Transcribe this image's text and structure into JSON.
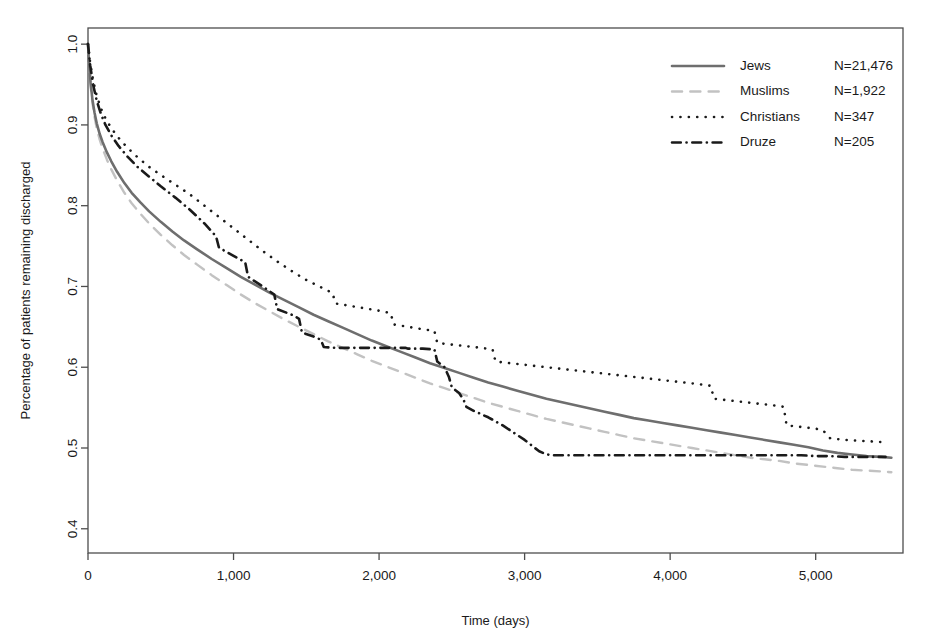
{
  "chart_data": {
    "type": "line",
    "title": "",
    "xlabel": "Time (days)",
    "ylabel": "Percentage of patients remaining discharged",
    "xlim": [
      0,
      5600
    ],
    "ylim": [
      0.37,
      1.02
    ],
    "xticks": [
      0,
      1000,
      2000,
      3000,
      4000,
      5000
    ],
    "xtick_labels": [
      "0",
      "1,000",
      "2,000",
      "3,000",
      "4,000",
      "5,000"
    ],
    "yticks": [
      0.4,
      0.5,
      0.6,
      0.7,
      0.8,
      0.9,
      1.0
    ],
    "ytick_labels": [
      "0.4",
      "0.5",
      "0.6",
      "0.7",
      "0.8",
      "0.9",
      "1.0"
    ],
    "grid": false,
    "frame": true,
    "legend_position": "top-right",
    "series": [
      {
        "name": "Jews",
        "count_label": "N=21,476",
        "style": "solid",
        "color": "#6e6e6e",
        "width": 2.6,
        "points": [
          [
            0,
            1.0
          ],
          [
            8,
            0.975
          ],
          [
            18,
            0.952
          ],
          [
            30,
            0.932
          ],
          [
            45,
            0.915
          ],
          [
            60,
            0.902
          ],
          [
            80,
            0.889
          ],
          [
            100,
            0.879
          ],
          [
            130,
            0.866
          ],
          [
            160,
            0.855
          ],
          [
            200,
            0.842
          ],
          [
            250,
            0.828
          ],
          [
            300,
            0.816
          ],
          [
            360,
            0.804
          ],
          [
            420,
            0.793
          ],
          [
            500,
            0.78
          ],
          [
            580,
            0.768
          ],
          [
            660,
            0.757
          ],
          [
            750,
            0.746
          ],
          [
            850,
            0.734
          ],
          [
            950,
            0.723
          ],
          [
            1050,
            0.712
          ],
          [
            1150,
            0.702
          ],
          [
            1250,
            0.692
          ],
          [
            1350,
            0.683
          ],
          [
            1450,
            0.674
          ],
          [
            1550,
            0.665
          ],
          [
            1650,
            0.657
          ],
          [
            1750,
            0.649
          ],
          [
            1850,
            0.641
          ],
          [
            1950,
            0.633
          ],
          [
            2050,
            0.626
          ],
          [
            2150,
            0.619
          ],
          [
            2250,
            0.612
          ],
          [
            2350,
            0.605
          ],
          [
            2450,
            0.599
          ],
          [
            2550,
            0.593
          ],
          [
            2650,
            0.587
          ],
          [
            2750,
            0.581
          ],
          [
            2850,
            0.576
          ],
          [
            2950,
            0.571
          ],
          [
            3050,
            0.566
          ],
          [
            3150,
            0.561
          ],
          [
            3250,
            0.557
          ],
          [
            3350,
            0.553
          ],
          [
            3450,
            0.549
          ],
          [
            3550,
            0.545
          ],
          [
            3650,
            0.541
          ],
          [
            3750,
            0.537
          ],
          [
            3850,
            0.534
          ],
          [
            3950,
            0.531
          ],
          [
            4050,
            0.528
          ],
          [
            4150,
            0.525
          ],
          [
            4250,
            0.522
          ],
          [
            4350,
            0.519
          ],
          [
            4450,
            0.516
          ],
          [
            4550,
            0.513
          ],
          [
            4650,
            0.51
          ],
          [
            4750,
            0.507
          ],
          [
            4850,
            0.504
          ],
          [
            4950,
            0.501
          ],
          [
            5050,
            0.497
          ],
          [
            5150,
            0.494
          ],
          [
            5250,
            0.492
          ],
          [
            5350,
            0.49
          ],
          [
            5450,
            0.489
          ],
          [
            5520,
            0.488
          ]
        ]
      },
      {
        "name": "Muslims",
        "count_label": "N=1,922",
        "style": "dashed",
        "color": "#c2c2c2",
        "width": 2.4,
        "points": [
          [
            0,
            1.0
          ],
          [
            8,
            0.972
          ],
          [
            18,
            0.948
          ],
          [
            30,
            0.928
          ],
          [
            45,
            0.91
          ],
          [
            60,
            0.896
          ],
          [
            80,
            0.882
          ],
          [
            100,
            0.871
          ],
          [
            130,
            0.857
          ],
          [
            160,
            0.845
          ],
          [
            200,
            0.831
          ],
          [
            250,
            0.816
          ],
          [
            300,
            0.803
          ],
          [
            360,
            0.79
          ],
          [
            420,
            0.778
          ],
          [
            500,
            0.764
          ],
          [
            580,
            0.751
          ],
          [
            660,
            0.739
          ],
          [
            750,
            0.727
          ],
          [
            850,
            0.714
          ],
          [
            950,
            0.702
          ],
          [
            1050,
            0.69
          ],
          [
            1150,
            0.679
          ],
          [
            1250,
            0.669
          ],
          [
            1350,
            0.659
          ],
          [
            1450,
            0.65
          ],
          [
            1550,
            0.641
          ],
          [
            1650,
            0.632
          ],
          [
            1750,
            0.624
          ],
          [
            1850,
            0.616
          ],
          [
            1950,
            0.608
          ],
          [
            2050,
            0.601
          ],
          [
            2150,
            0.594
          ],
          [
            2250,
            0.587
          ],
          [
            2350,
            0.58
          ],
          [
            2450,
            0.574
          ],
          [
            2550,
            0.568
          ],
          [
            2650,
            0.562
          ],
          [
            2750,
            0.556
          ],
          [
            2850,
            0.551
          ],
          [
            2950,
            0.546
          ],
          [
            3050,
            0.541
          ],
          [
            3150,
            0.536
          ],
          [
            3250,
            0.532
          ],
          [
            3350,
            0.528
          ],
          [
            3450,
            0.524
          ],
          [
            3550,
            0.52
          ],
          [
            3650,
            0.516
          ],
          [
            3750,
            0.512
          ],
          [
            3850,
            0.509
          ],
          [
            3950,
            0.506
          ],
          [
            4050,
            0.503
          ],
          [
            4150,
            0.5
          ],
          [
            4250,
            0.497
          ],
          [
            4350,
            0.494
          ],
          [
            4450,
            0.491
          ],
          [
            4550,
            0.488
          ],
          [
            4650,
            0.486
          ],
          [
            4750,
            0.484
          ],
          [
            4850,
            0.481
          ],
          [
            4950,
            0.479
          ],
          [
            5050,
            0.477
          ],
          [
            5150,
            0.475
          ],
          [
            5250,
            0.473
          ],
          [
            5350,
            0.472
          ],
          [
            5450,
            0.471
          ],
          [
            5520,
            0.47
          ]
        ]
      },
      {
        "name": "Christians",
        "count_label": "N=347",
        "style": "dotted",
        "color": "#1a1a1a",
        "width": 2.6,
        "points": [
          [
            0,
            1.0
          ],
          [
            15,
            0.977
          ],
          [
            35,
            0.955
          ],
          [
            60,
            0.936
          ],
          [
            90,
            0.92
          ],
          [
            120,
            0.908
          ],
          [
            160,
            0.896
          ],
          [
            210,
            0.884
          ],
          [
            270,
            0.872
          ],
          [
            340,
            0.86
          ],
          [
            420,
            0.848
          ],
          [
            500,
            0.838
          ],
          [
            600,
            0.826
          ],
          [
            700,
            0.814
          ],
          [
            800,
            0.8
          ],
          [
            900,
            0.786
          ],
          [
            1000,
            0.772
          ],
          [
            1100,
            0.758
          ],
          [
            1200,
            0.744
          ],
          [
            1300,
            0.731
          ],
          [
            1400,
            0.719
          ],
          [
            1500,
            0.708
          ],
          [
            1600,
            0.699
          ],
          [
            1680,
            0.692
          ],
          [
            1700,
            0.679
          ],
          [
            1800,
            0.676
          ],
          [
            1900,
            0.673
          ],
          [
            2000,
            0.67
          ],
          [
            2080,
            0.667
          ],
          [
            2100,
            0.653
          ],
          [
            2200,
            0.65
          ],
          [
            2300,
            0.647
          ],
          [
            2380,
            0.645
          ],
          [
            2400,
            0.63
          ],
          [
            2500,
            0.628
          ],
          [
            2600,
            0.626
          ],
          [
            2700,
            0.624
          ],
          [
            2780,
            0.622
          ],
          [
            2800,
            0.607
          ],
          [
            2900,
            0.605
          ],
          [
            3000,
            0.603
          ],
          [
            3100,
            0.601
          ],
          [
            3200,
            0.599
          ],
          [
            3300,
            0.597
          ],
          [
            3400,
            0.595
          ],
          [
            3500,
            0.593
          ],
          [
            3600,
            0.591
          ],
          [
            3700,
            0.589
          ],
          [
            3800,
            0.587
          ],
          [
            3900,
            0.585
          ],
          [
            4000,
            0.583
          ],
          [
            4100,
            0.581
          ],
          [
            4200,
            0.579
          ],
          [
            4280,
            0.577
          ],
          [
            4300,
            0.561
          ],
          [
            4400,
            0.559
          ],
          [
            4500,
            0.557
          ],
          [
            4600,
            0.555
          ],
          [
            4700,
            0.553
          ],
          [
            4780,
            0.551
          ],
          [
            4800,
            0.528
          ],
          [
            4900,
            0.526
          ],
          [
            5000,
            0.524
          ],
          [
            5050,
            0.522
          ],
          [
            5100,
            0.512
          ],
          [
            5200,
            0.51
          ],
          [
            5300,
            0.509
          ],
          [
            5400,
            0.508
          ],
          [
            5480,
            0.507
          ]
        ]
      },
      {
        "name": "Druze",
        "count_label": "N=205",
        "style": "dashdot",
        "color": "#1a1a1a",
        "width": 2.6,
        "points": [
          [
            0,
            1.0
          ],
          [
            15,
            0.974
          ],
          [
            35,
            0.95
          ],
          [
            60,
            0.93
          ],
          [
            90,
            0.913
          ],
          [
            120,
            0.9
          ],
          [
            160,
            0.887
          ],
          [
            210,
            0.874
          ],
          [
            270,
            0.861
          ],
          [
            340,
            0.848
          ],
          [
            420,
            0.836
          ],
          [
            500,
            0.824
          ],
          [
            600,
            0.81
          ],
          [
            700,
            0.795
          ],
          [
            800,
            0.778
          ],
          [
            880,
            0.762
          ],
          [
            900,
            0.748
          ],
          [
            1000,
            0.738
          ],
          [
            1080,
            0.73
          ],
          [
            1100,
            0.712
          ],
          [
            1200,
            0.7
          ],
          [
            1280,
            0.69
          ],
          [
            1300,
            0.672
          ],
          [
            1400,
            0.665
          ],
          [
            1450,
            0.66
          ],
          [
            1470,
            0.643
          ],
          [
            1550,
            0.638
          ],
          [
            1600,
            0.634
          ],
          [
            1620,
            0.625
          ],
          [
            1700,
            0.624
          ],
          [
            1800,
            0.624
          ],
          [
            1900,
            0.624
          ],
          [
            2000,
            0.624
          ],
          [
            2100,
            0.624
          ],
          [
            2180,
            0.624
          ],
          [
            2200,
            0.623
          ],
          [
            2300,
            0.623
          ],
          [
            2380,
            0.622
          ],
          [
            2400,
            0.607
          ],
          [
            2450,
            0.6
          ],
          [
            2480,
            0.588
          ],
          [
            2500,
            0.575
          ],
          [
            2550,
            0.568
          ],
          [
            2580,
            0.56
          ],
          [
            2600,
            0.551
          ],
          [
            2650,
            0.546
          ],
          [
            2700,
            0.542
          ],
          [
            2750,
            0.538
          ],
          [
            2800,
            0.533
          ],
          [
            2850,
            0.528
          ],
          [
            2900,
            0.522
          ],
          [
            2950,
            0.516
          ],
          [
            3000,
            0.51
          ],
          [
            3050,
            0.503
          ],
          [
            3100,
            0.496
          ],
          [
            3150,
            0.492
          ],
          [
            3200,
            0.491
          ],
          [
            3300,
            0.491
          ],
          [
            3400,
            0.491
          ],
          [
            3500,
            0.491
          ],
          [
            3600,
            0.491
          ],
          [
            3700,
            0.491
          ],
          [
            3800,
            0.491
          ],
          [
            3900,
            0.491
          ],
          [
            4000,
            0.491
          ],
          [
            4100,
            0.491
          ],
          [
            4200,
            0.491
          ],
          [
            4300,
            0.491
          ],
          [
            4400,
            0.491
          ],
          [
            4500,
            0.491
          ],
          [
            4600,
            0.491
          ],
          [
            4700,
            0.491
          ],
          [
            4800,
            0.491
          ],
          [
            4900,
            0.491
          ],
          [
            5000,
            0.49
          ],
          [
            5100,
            0.49
          ],
          [
            5200,
            0.489
          ],
          [
            5300,
            0.489
          ],
          [
            5400,
            0.489
          ],
          [
            5480,
            0.489
          ]
        ]
      }
    ]
  },
  "legend": {
    "entries": [
      {
        "label": "Jews",
        "count": "N=21,476"
      },
      {
        "label": "Muslims",
        "count": "N=1,922"
      },
      {
        "label": "Christians",
        "count": "N=347"
      },
      {
        "label": "Druze",
        "count": "N=205"
      }
    ]
  },
  "colors": {
    "jews": "#6e6e6e",
    "muslims": "#c2c2c2",
    "christians": "#1a1a1a",
    "druze": "#1a1a1a",
    "frame": "#4d4d4d",
    "background": "#ffffff"
  }
}
